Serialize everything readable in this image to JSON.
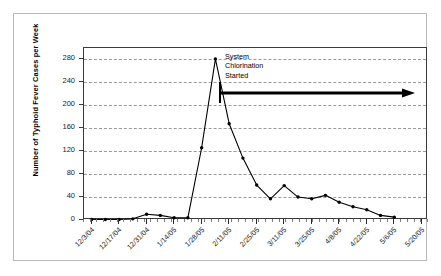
{
  "chart_data": {
    "type": "line",
    "title": "",
    "xlabel": "",
    "ylabel": "Number of Typhoid Fever Cases per Week",
    "ylim": [
      0,
      300
    ],
    "yticks": [
      0,
      40,
      80,
      120,
      160,
      200,
      240,
      280
    ],
    "grid": true,
    "legend": "none",
    "x_tick_labels": [
      "12/3/04",
      "12/17/04",
      "12/31/04",
      "1/14/05",
      "1/28/05",
      "2/11/05",
      "2/25/05",
      "3/11/05",
      "3/25/05",
      "4/8/05",
      "4/22/05",
      "5/6/05",
      "5/20/05"
    ],
    "categories": [
      "12/3/04",
      "12/10/04",
      "12/17/04",
      "12/24/04",
      "12/31/04",
      "1/7/05",
      "1/14/05",
      "1/21/05",
      "1/28/05",
      "2/4/05",
      "2/11/05",
      "2/18/05",
      "2/25/05",
      "3/4/05",
      "3/11/05",
      "3/18/05",
      "3/25/05",
      "4/1/05",
      "4/8/05",
      "4/15/05",
      "4/22/05",
      "4/29/05",
      "5/6/05"
    ],
    "values": [
      1,
      1,
      1,
      2,
      10,
      8,
      4,
      4,
      126,
      281,
      168,
      108,
      61,
      37,
      60,
      40,
      37,
      43,
      31,
      23,
      18,
      8,
      5
    ],
    "annotations": [
      {
        "name": "chlorination-annotation",
        "text": "System\nChlorination\nStarted",
        "marker_x": "2/14/05",
        "arrow_y_value": 215,
        "arrow_direction": "right"
      }
    ],
    "colors": {
      "series_line": "#000000",
      "marker": "#000000",
      "gridline": "#9a9a9a",
      "axis": "#3a3a3a",
      "frame": "#b9b9b9",
      "background": "#ffffff"
    }
  }
}
